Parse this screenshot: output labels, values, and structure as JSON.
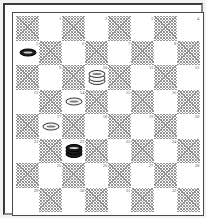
{
  "diagram": {
    "kind": "checkers-board-diagram",
    "board_size": 8,
    "numbered_squares_total": 32,
    "colors": {
      "page_background": "#f2f2f2",
      "board_background": "#ffffff",
      "hatched_square": "#8f8f8f",
      "frame_dark": "#3a3a3a",
      "frame_light": "#8a8a8a",
      "square_number_text": "#555555",
      "light_piece": "#f6f6f6",
      "dark_piece": "#1c1c1c"
    },
    "rows": [
      {
        "row": 1,
        "cells": [
          {
            "shade": "dark",
            "number": "",
            "piece": null
          },
          {
            "shade": "light",
            "number": "1",
            "piece": null
          },
          {
            "shade": "dark",
            "number": "",
            "piece": null
          },
          {
            "shade": "light",
            "number": "2",
            "piece": null
          },
          {
            "shade": "dark",
            "number": "",
            "piece": null
          },
          {
            "shade": "light",
            "number": "3",
            "piece": null
          },
          {
            "shade": "dark",
            "number": "",
            "piece": null
          },
          {
            "shade": "light",
            "number": "4",
            "piece": null
          }
        ]
      },
      {
        "row": 2,
        "cells": [
          {
            "shade": "light",
            "number": "5",
            "piece": {
              "color": "dark",
              "rank": "man"
            }
          },
          {
            "shade": "dark",
            "number": "",
            "piece": null
          },
          {
            "shade": "light",
            "number": "6",
            "piece": null
          },
          {
            "shade": "dark",
            "number": "",
            "piece": null
          },
          {
            "shade": "light",
            "number": "7",
            "piece": null
          },
          {
            "shade": "dark",
            "number": "",
            "piece": null
          },
          {
            "shade": "light",
            "number": "8",
            "piece": null
          },
          {
            "shade": "dark",
            "number": "",
            "piece": null
          }
        ]
      },
      {
        "row": 3,
        "cells": [
          {
            "shade": "dark",
            "number": "",
            "piece": null
          },
          {
            "shade": "light",
            "number": "9",
            "piece": null
          },
          {
            "shade": "dark",
            "number": "",
            "piece": null
          },
          {
            "shade": "light",
            "number": "10",
            "piece": {
              "color": "light",
              "rank": "king"
            }
          },
          {
            "shade": "dark",
            "number": "",
            "piece": null
          },
          {
            "shade": "light",
            "number": "11",
            "piece": null
          },
          {
            "shade": "dark",
            "number": "",
            "piece": null
          },
          {
            "shade": "light",
            "number": "12",
            "piece": null
          }
        ]
      },
      {
        "row": 4,
        "cells": [
          {
            "shade": "light",
            "number": "13",
            "piece": null
          },
          {
            "shade": "dark",
            "number": "",
            "piece": null
          },
          {
            "shade": "light",
            "number": "14",
            "piece": {
              "color": "light",
              "rank": "man"
            }
          },
          {
            "shade": "dark",
            "number": "",
            "piece": null
          },
          {
            "shade": "light",
            "number": "15",
            "piece": null
          },
          {
            "shade": "dark",
            "number": "",
            "piece": null
          },
          {
            "shade": "light",
            "number": "16",
            "piece": null
          },
          {
            "shade": "dark",
            "number": "",
            "piece": null
          }
        ]
      },
      {
        "row": 5,
        "cells": [
          {
            "shade": "dark",
            "number": "",
            "piece": null
          },
          {
            "shade": "light",
            "number": "17",
            "piece": {
              "color": "light",
              "rank": "man"
            }
          },
          {
            "shade": "dark",
            "number": "",
            "piece": null
          },
          {
            "shade": "light",
            "number": "18",
            "piece": null
          },
          {
            "shade": "dark",
            "number": "",
            "piece": null
          },
          {
            "shade": "light",
            "number": "19",
            "piece": null
          },
          {
            "shade": "dark",
            "number": "",
            "piece": null
          },
          {
            "shade": "light",
            "number": "20",
            "piece": null
          }
        ]
      },
      {
        "row": 6,
        "cells": [
          {
            "shade": "light",
            "number": "21",
            "piece": null
          },
          {
            "shade": "dark",
            "number": "",
            "piece": null
          },
          {
            "shade": "light",
            "number": "22",
            "piece": {
              "color": "dark",
              "rank": "king"
            }
          },
          {
            "shade": "dark",
            "number": "",
            "piece": null
          },
          {
            "shade": "light",
            "number": "23",
            "piece": null
          },
          {
            "shade": "dark",
            "number": "",
            "piece": null
          },
          {
            "shade": "light",
            "number": "24",
            "piece": null
          },
          {
            "shade": "dark",
            "number": "",
            "piece": null
          }
        ]
      },
      {
        "row": 7,
        "cells": [
          {
            "shade": "dark",
            "number": "",
            "piece": null
          },
          {
            "shade": "light",
            "number": "25",
            "piece": null
          },
          {
            "shade": "dark",
            "number": "",
            "piece": null
          },
          {
            "shade": "light",
            "number": "26",
            "piece": null
          },
          {
            "shade": "dark",
            "number": "",
            "piece": null
          },
          {
            "shade": "light",
            "number": "27",
            "piece": null
          },
          {
            "shade": "dark",
            "number": "",
            "piece": null
          },
          {
            "shade": "light",
            "number": "28",
            "piece": null
          }
        ]
      },
      {
        "row": 8,
        "cells": [
          {
            "shade": "light",
            "number": "29",
            "piece": null
          },
          {
            "shade": "dark",
            "number": "",
            "piece": null
          },
          {
            "shade": "light",
            "number": "30",
            "piece": null
          },
          {
            "shade": "dark",
            "number": "",
            "piece": null
          },
          {
            "shade": "light",
            "number": "31",
            "piece": null
          },
          {
            "shade": "dark",
            "number": "",
            "piece": null
          },
          {
            "shade": "light",
            "number": "32",
            "piece": null
          },
          {
            "shade": "dark",
            "number": "",
            "piece": null
          }
        ]
      }
    ],
    "position": {
      "light_pieces": [
        {
          "square": "10",
          "rank": "king"
        },
        {
          "square": "14",
          "rank": "man"
        },
        {
          "square": "17",
          "rank": "man"
        }
      ],
      "dark_pieces": [
        {
          "square": "5",
          "rank": "man"
        },
        {
          "square": "22",
          "rank": "king"
        }
      ]
    }
  }
}
